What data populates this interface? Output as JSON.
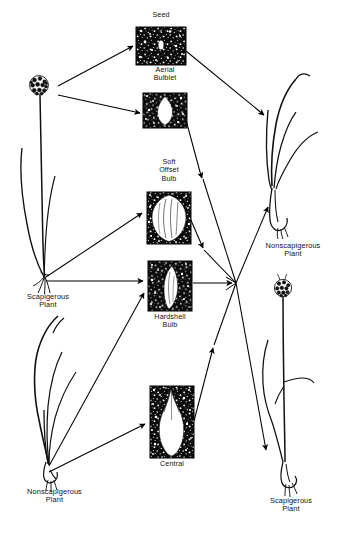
{
  "diagram": {
    "background_color": "#ffffff",
    "ink_color": "#000000"
  },
  "propagules": [
    {
      "id": "seed",
      "label": "Seed",
      "label_lines": "Seed",
      "label_position": "above",
      "box": {
        "x": 136,
        "y": 27,
        "w": 50,
        "h": 38
      },
      "fill_color": "#0b0b0b",
      "speckle_color": "#ffffff",
      "shape": "tiny-oval-seed"
    },
    {
      "id": "aerial-bulblet",
      "label": "Aerial Bulblet",
      "label_lines": "Aerial\nBulblet",
      "label_position": "above",
      "box": {
        "x": 143,
        "y": 93,
        "w": 44,
        "h": 35
      },
      "fill_color": "#0b0b0b",
      "speckle_color": "#ffffff",
      "shape": "small-pointed-bulblet"
    },
    {
      "id": "soft-offset-bulb",
      "label": "Soft Offset Bulb",
      "label_lines": "Soft\nOffset\nBulb",
      "label_position": "above",
      "box": {
        "x": 147,
        "y": 192,
        "w": 44,
        "h": 52
      },
      "fill_color": "#0b0b0b",
      "speckle_color": "#ffffff",
      "shape": "large-round-ribbed-bulb"
    },
    {
      "id": "hardshell-bulb",
      "label": "Hardshell Bulb",
      "label_lines": "Hardshell\nBulb",
      "label_position": "below",
      "box": {
        "x": 148,
        "y": 261,
        "w": 44,
        "h": 50
      },
      "fill_color": "#0b0b0b",
      "speckle_color": "#ffffff",
      "shape": "narrow-crescent-bulb"
    },
    {
      "id": "central",
      "label": "Central",
      "label_lines": "Central",
      "label_position": "below",
      "box": {
        "x": 150,
        "y": 386,
        "w": 44,
        "h": 72
      },
      "fill_color": "#0b0b0b",
      "speckle_color": "#ffffff",
      "shape": "tall-flame-central-bulb"
    }
  ],
  "plants": [
    {
      "id": "scapigerous-plant-left",
      "label": "Scapigerous Plant",
      "label_lines": "Scapigerous\nPlant",
      "type": "scapigerous",
      "has_flower_head": true,
      "position": "left-upper",
      "label_x": 16,
      "label_y": 292
    },
    {
      "id": "nonscapigerous-plant-left",
      "label": "Nonscapigerous Plant",
      "label_lines": "Nonscapigerous\nPlant",
      "type": "nonscapigerous",
      "has_flower_head": false,
      "position": "left-lower",
      "label_x": 8,
      "label_y": 487
    },
    {
      "id": "nonscapigerous-plant-right",
      "label": "Nonscapigerous Plant",
      "label_lines": "Nonscapigerous\nPlant",
      "type": "nonscapigerous",
      "has_flower_head": false,
      "position": "right-upper",
      "label_x": 256,
      "label_y": 243
    },
    {
      "id": "scapigerous-plant-right",
      "label": "Scapigerous Plant",
      "label_lines": "Scapigerous\nPlant",
      "type": "scapigerous",
      "has_flower_head": true,
      "position": "right-lower",
      "label_x": 260,
      "label_y": 496
    }
  ],
  "flows": [
    {
      "id": "flow-scapL-to-seed",
      "from": "scapigerous-plant-left",
      "to": "seed",
      "arrow": true
    },
    {
      "id": "flow-scapL-to-aerial",
      "from": "scapigerous-plant-left",
      "to": "aerial-bulblet",
      "arrow": true
    },
    {
      "id": "flow-scapL-to-soft",
      "from": "scapigerous-plant-left",
      "to": "soft-offset-bulb",
      "arrow": true
    },
    {
      "id": "flow-scapL-to-hardshell",
      "from": "scapigerous-plant-left",
      "to": "hardshell-bulb",
      "arrow": true
    },
    {
      "id": "flow-nonscapL-to-hardshell",
      "from": "nonscapigerous-plant-left",
      "to": "hardshell-bulb",
      "arrow": true
    },
    {
      "id": "flow-nonscapL-to-central",
      "from": "nonscapigerous-plant-left",
      "to": "central",
      "arrow": true
    },
    {
      "id": "flow-seed-to-nonscapR",
      "from": "seed",
      "to": "nonscapigerous-plant-right",
      "arrow": true
    },
    {
      "id": "flow-aerial-to-node",
      "from": "aerial-bulblet",
      "to": "junction-node",
      "arrow": true
    },
    {
      "id": "flow-soft-to-node",
      "from": "soft-offset-bulb",
      "to": "junction-node",
      "arrow": true
    },
    {
      "id": "flow-hardshell-to-node",
      "from": "hardshell-bulb",
      "to": "junction-node",
      "arrow": true
    },
    {
      "id": "flow-central-to-node",
      "from": "central",
      "to": "junction-node",
      "arrow": true
    },
    {
      "id": "flow-node-to-nonscapR",
      "from": "junction-node",
      "to": "nonscapigerous-plant-right",
      "arrow": true
    },
    {
      "id": "flow-node-to-scapR",
      "from": "junction-node",
      "to": "scapigerous-plant-right",
      "arrow": true
    }
  ],
  "junction": {
    "id": "junction-node",
    "x": 236,
    "y": 283
  }
}
